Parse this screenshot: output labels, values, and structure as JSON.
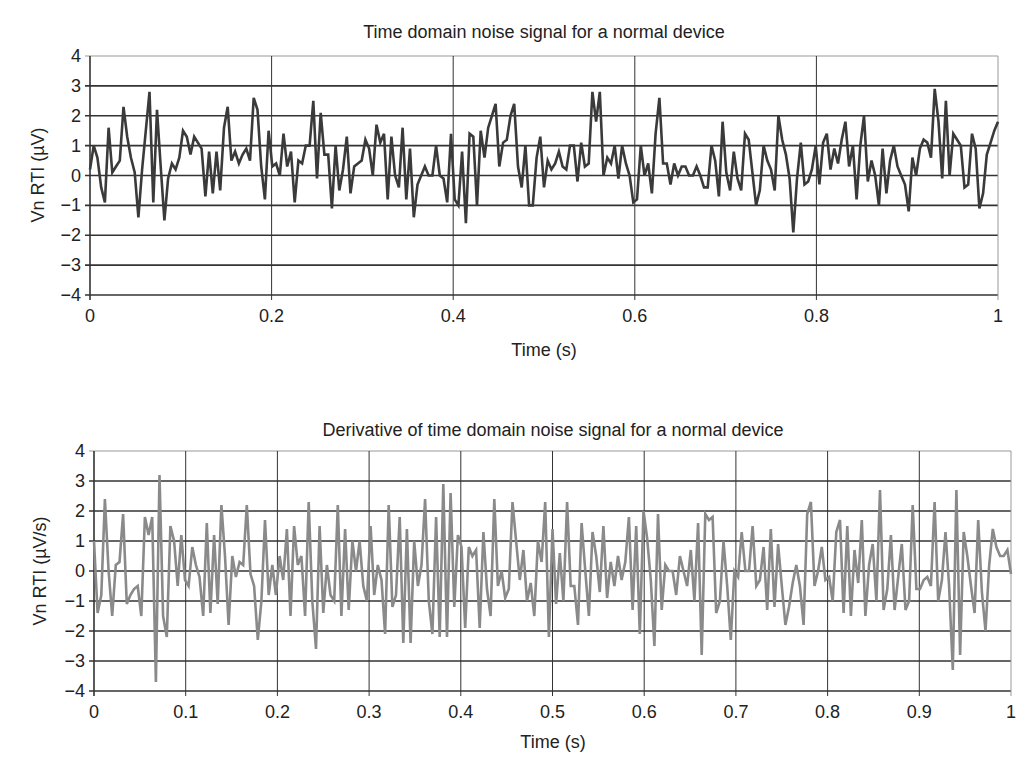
{
  "charts": [
    {
      "id": "top",
      "title": "Time domain noise signal for a normal device",
      "xlabel": "Time (s)",
      "ylabel": "Vn RTI (µV)",
      "x_ticks": [
        "0",
        "0.2",
        "0.4",
        "0.6",
        "0.8",
        "1"
      ],
      "y_ticks": [
        "4",
        "3",
        "2",
        "1",
        "0",
        "−1",
        "−2",
        "−3",
        "−4"
      ],
      "line_color": "#3a3a3a",
      "grid_color": "#333333"
    },
    {
      "id": "bottom",
      "title": "Derivative of time domain noise signal for a normal device",
      "xlabel": "Time (s)",
      "ylabel": "Vn RTI (µV/s)",
      "x_ticks": [
        "0",
        "0.1",
        "0.2",
        "0.3",
        "0.4",
        "0.5",
        "0.6",
        "0.7",
        "0.8",
        "0.9",
        "1"
      ],
      "y_ticks": [
        "4",
        "3",
        "2",
        "1",
        "0",
        "−1",
        "−2",
        "−3",
        "−4"
      ],
      "line_color": "#8a8a8a",
      "grid_color": "#333333"
    }
  ],
  "chart_data": [
    {
      "type": "line",
      "title": "Time domain noise signal for a normal device",
      "xlabel": "Time (s)",
      "ylabel": "Vn RTI (µV)",
      "xlim": [
        0,
        1
      ],
      "ylim": [
        -4,
        4
      ],
      "x_ticks": [
        0,
        0.2,
        0.4,
        0.6,
        0.8,
        1
      ],
      "y_ticks": [
        -4,
        -3,
        -2,
        -1,
        0,
        1,
        2,
        3,
        4
      ],
      "grid": true,
      "legend": null,
      "series": [
        {
          "name": "Vn RTI",
          "x_step": 0.005,
          "values": [
            0.2,
            1.0,
            0.6,
            -0.4,
            -0.9,
            1.6,
            0.1,
            0.3,
            0.5,
            2.3,
            1.3,
            0.6,
            0.1,
            -1.4,
            0.2,
            1.5,
            2.8,
            -0.9,
            2.2,
            0.3,
            -1.5,
            -0.1,
            0.4,
            0.2,
            0.6,
            1.5,
            1.3,
            0.7,
            1.3,
            1.1,
            0.9,
            -0.7,
            0.8,
            -0.6,
            0.8,
            -0.5,
            1.6,
            2.3,
            0.5,
            0.8,
            0.4,
            0.7,
            0.9,
            0.5,
            2.6,
            2.2,
            0.3,
            -0.8,
            1.5,
            0.3,
            0.4,
            0.0,
            1.4,
            0.3,
            0.8,
            -0.9,
            0.5,
            0.4,
            1.0,
            1.0,
            2.5,
            -0.1,
            2.1,
            0.7,
            0.7,
            -1.1,
            1.0,
            -0.5,
            0.2,
            1.3,
            -0.6,
            0.3,
            0.4,
            0.5,
            1.2,
            0.9,
            0.0,
            1.7,
            1.1,
            1.4,
            -0.8,
            1.3,
            0.0,
            -0.4,
            1.6,
            -0.8,
            0.9,
            -1.4,
            -0.3,
            0.0,
            0.3,
            0.0,
            0.0,
            1.0,
            0.0,
            -0.1,
            -0.9,
            1.4,
            -0.8,
            -1.0,
            0.8,
            -1.6,
            1.4,
            1.3,
            -1.0,
            1.5,
            0.6,
            1.6,
            2.0,
            2.4,
            0.3,
            1.1,
            1.2,
            2.0,
            2.4,
            0.3,
            -0.4,
            1.0,
            -1.0,
            -1.0,
            0.6,
            1.3,
            -0.4,
            0.5,
            0.2,
            0.4,
            0.8,
            0.3,
            0.2,
            1.0,
            1.0,
            -0.2,
            1.1,
            0.3,
            0.4,
            2.8,
            1.8,
            2.8,
            0.0,
            0.6,
            0.4,
            1.0,
            -0.1,
            1.0,
            0.4,
            0.0,
            -0.9,
            -0.8,
            1.0,
            0.0,
            0.4,
            -0.6,
            1.4,
            2.6,
            0.4,
            0.4,
            -0.3,
            0.4,
            0.0,
            0.3,
            0.3,
            0.0,
            0.0,
            0.3,
            0.0,
            -0.4,
            -0.4,
            1.0,
            0.5,
            -0.7,
            1.8,
            0.1,
            -0.5,
            0.8,
            -0.1,
            -0.5,
            1.4,
            1.2,
            0.1,
            -1.0,
            -0.5,
            1.0,
            0.5,
            0.2,
            -0.5,
            2.0,
            1.2,
            0.7,
            -0.1,
            -1.9,
            -0.1,
            1.1,
            -0.3,
            -0.2,
            0.2,
            1.0,
            -0.3,
            1.1,
            1.4,
            0.2,
            0.9,
            0.4,
            1.2,
            1.8,
            0.3,
            1.0,
            -0.8,
            1.0,
            2.0,
            -0.2,
            0.5,
            0.0,
            -1.0,
            0.9,
            -0.6,
            0.5,
            1.0,
            0.3,
            0.0,
            -0.3,
            -1.2,
            0.6,
            0.0,
            0.9,
            1.2,
            1.1,
            0.6,
            2.9,
            1.8,
            -0.1,
            2.5,
            0.0,
            1.4,
            1.2,
            1.0,
            -0.4,
            -0.3,
            1.4,
            0.9,
            -1.1,
            -0.6,
            0.7,
            1.1,
            1.5,
            1.8
          ]
        }
      ]
    },
    {
      "type": "line",
      "title": "Derivative of time domain noise signal for a normal device",
      "xlabel": "Time (s)",
      "ylabel": "Vn RTI (µV/s)",
      "xlim": [
        0,
        1
      ],
      "ylim": [
        -4,
        4
      ],
      "x_ticks": [
        0,
        0.1,
        0.2,
        0.3,
        0.4,
        0.5,
        0.6,
        0.7,
        0.8,
        0.9,
        1
      ],
      "y_ticks": [
        -4,
        -3,
        -2,
        -1,
        0,
        1,
        2,
        3,
        4
      ],
      "grid": true,
      "legend": null,
      "series": [
        {
          "name": "dVn/dt RTI",
          "x_step": 0.004,
          "values": [
            1.0,
            -1.4,
            -0.8,
            2.4,
            0.0,
            -1.5,
            0.2,
            0.3,
            1.9,
            -1.1,
            -0.8,
            -0.6,
            -0.5,
            -1.5,
            1.8,
            1.2,
            1.8,
            -3.7,
            3.2,
            -1.5,
            -2.2,
            1.5,
            1.0,
            -0.5,
            1.2,
            -0.3,
            -0.5,
            0.8,
            0.2,
            -0.2,
            -1.5,
            1.6,
            -1.4,
            1.2,
            -1.1,
            2.2,
            0.5,
            -1.8,
            0.5,
            -0.2,
            0.3,
            0.2,
            2.2,
            -0.1,
            -0.5,
            -2.3,
            -1.0,
            1.7,
            -0.8,
            0.2,
            -0.8,
            0.5,
            -0.3,
            1.4,
            -1.5,
            1.5,
            0.2,
            0.5,
            -1.5,
            2.3,
            -1.0,
            -2.6,
            1.5,
            -1.4,
            0.2,
            -0.8,
            -1.0,
            2.2,
            -1.5,
            1.4,
            -1.3,
            1.0,
            0.0,
            1.0,
            -0.5,
            -1.0,
            1.5,
            -0.8,
            0.2,
            -0.3,
            -2.1,
            2.2,
            -1.2,
            -0.8,
            1.8,
            -2.4,
            1.4,
            -2.4,
            1.0,
            -0.5,
            0.2,
            2.4,
            -1.0,
            -2.1,
            1.8,
            -2.2,
            2.9,
            -2.2,
            2.6,
            -1.2,
            1.2,
            0.8,
            -1.9,
            0.8,
            0.5,
            0.7,
            -1.9,
            1.3,
            -0.6,
            -1.5,
            2.4,
            -0.5,
            0.0,
            -0.9,
            -0.6,
            2.3,
            1.0,
            -0.3,
            0.7,
            -1.0,
            -0.4,
            -1.5,
            1.0,
            0.3,
            2.3,
            -2.2,
            1.4,
            -1.1,
            0.6,
            -1.0,
            2.3,
            -0.5,
            -0.5,
            -1.8,
            1.6,
            0.0,
            -1.5,
            1.3,
            0.5,
            -0.7,
            1.5,
            -0.9,
            0.3,
            -0.5,
            0.5,
            -0.3,
            0.3,
            1.8,
            -1.3,
            1.5,
            -2.1,
            2.0,
            1.1,
            -0.3,
            -2.5,
            1.9,
            -1.3,
            0.2,
            0.0,
            0.0,
            -0.8,
            0.5,
            0.0,
            -0.5,
            0.7,
            -1.0,
            1.6,
            -2.8,
            1.9,
            1.7,
            1.8,
            -1.4,
            -1.0,
            1.0,
            -0.5,
            -2.3,
            0.0,
            -0.2,
            1.3,
            0.0,
            0.0,
            1.5,
            -0.5,
            -0.3,
            0.8,
            -1.3,
            1.4,
            -1.2,
            0.9,
            -0.5,
            -1.8,
            -1.2,
            -0.4,
            0.2,
            -0.5,
            -1.8,
            1.9,
            2.3,
            -0.5,
            0.0,
            0.8,
            -0.3,
            -0.2,
            -1.0,
            1.3,
            1.7,
            -1.4,
            1.5,
            -1.5,
            0.7,
            -0.4,
            1.7,
            -1.5,
            0.2,
            0.9,
            -1.0,
            2.7,
            -1.3,
            -0.6,
            1.2,
            -1.3,
            -0.2,
            0.9,
            -1.3,
            -1.0,
            2.2,
            -0.6,
            -0.6,
            -0.3,
            -0.2,
            -0.5,
            2.3,
            -1.0,
            -0.3,
            1.3,
            -0.5,
            -3.3,
            2.7,
            -2.8,
            1.3,
            0.5,
            -0.5,
            -1.4,
            1.7,
            -0.7,
            -2.0,
            0.2,
            1.4,
            0.8,
            0.5,
            0.5,
            0.7,
            -0.1
          ]
        }
      ]
    }
  ]
}
